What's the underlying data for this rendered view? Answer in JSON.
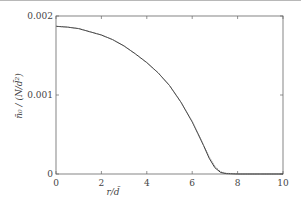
{
  "chart_data": {
    "type": "line",
    "title": "",
    "xlabel": "r/d̄",
    "ylabel": "n̄₀/(N/d̄²)",
    "xlim": [
      0,
      10
    ],
    "ylim": [
      0,
      0.002
    ],
    "xticks": [
      0,
      2,
      4,
      6,
      8,
      10
    ],
    "xtick_labels": [
      "0",
      "2",
      "4",
      "6",
      "8",
      "10"
    ],
    "yticks": [
      0,
      0.001,
      0.002
    ],
    "ytick_labels": [
      "0",
      "0.001",
      "0.002"
    ],
    "grid": false,
    "legend": null,
    "series": [
      {
        "name": "solid",
        "style": "solid",
        "x": [
          0,
          0.5,
          1,
          1.5,
          2,
          2.5,
          3,
          3.5,
          4,
          4.5,
          5,
          5.5,
          6,
          6.25,
          6.5,
          6.75,
          7,
          7.25,
          7.5,
          8,
          9,
          10
        ],
        "values": [
          0.00187,
          0.00186,
          0.00184,
          0.0018,
          0.00176,
          0.0017,
          0.00162,
          0.00152,
          0.00141,
          0.00128,
          0.00112,
          0.00091,
          0.00066,
          0.00051,
          0.00036,
          0.0002,
          8e-05,
          2e-05,
          5e-06,
          0,
          0,
          0
        ]
      },
      {
        "name": "dotted",
        "style": "dotted",
        "x": [
          0,
          0.5,
          1,
          1.5,
          2,
          2.5,
          3,
          3.5,
          4,
          4.5,
          5,
          5.5,
          6,
          6.25,
          6.5,
          6.75,
          7,
          7.25,
          7.5,
          8,
          9,
          10
        ],
        "values": [
          0.00187,
          0.00186,
          0.00184,
          0.0018,
          0.00176,
          0.0017,
          0.00162,
          0.00152,
          0.00141,
          0.00128,
          0.00112,
          0.00091,
          0.00067,
          0.00052,
          0.00037,
          0.00022,
          0.0001,
          3e-05,
          1e-05,
          0,
          0,
          0
        ]
      }
    ]
  },
  "labels": {
    "x_axis": "r/d̄",
    "y_axis": "n̄₀ / (N/d̄²)"
  }
}
